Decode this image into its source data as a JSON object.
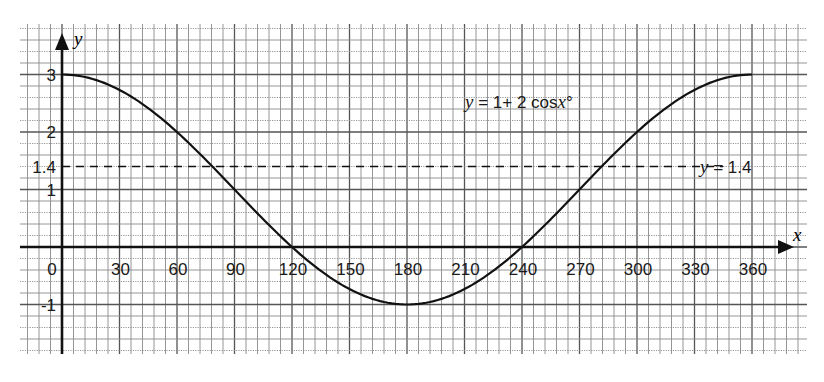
{
  "chart_data": {
    "type": "line",
    "title": "",
    "xlabel": "x",
    "ylabel": "y",
    "xlim": [
      0,
      360
    ],
    "ylim": [
      -1,
      3
    ],
    "grid": true,
    "x_ticks": [
      0,
      30,
      60,
      90,
      120,
      150,
      180,
      210,
      240,
      270,
      300,
      330,
      360
    ],
    "x_tick_labels": [
      "0",
      "30",
      "60",
      "90",
      "120",
      "150",
      "180",
      "210",
      "240",
      "270",
      "300",
      "330",
      "360"
    ],
    "y_ticks": [
      -1,
      1,
      1.4,
      2,
      3
    ],
    "y_tick_labels": [
      "-1",
      "1",
      "1.4",
      "2",
      "3"
    ],
    "series": [
      {
        "name": "y = 1+ 2 cosx°",
        "style": "solid",
        "x": [
          0,
          30,
          60,
          90,
          120,
          150,
          180,
          210,
          240,
          270,
          300,
          330,
          360
        ],
        "values": [
          3,
          2.73,
          2,
          1,
          0,
          -0.73,
          -1,
          -0.73,
          0,
          1,
          2,
          2.73,
          3
        ]
      },
      {
        "name": "y = 1.4",
        "style": "dashed",
        "x": [
          0,
          345
        ],
        "values": [
          1.4,
          1.4
        ]
      }
    ],
    "annotations": [
      {
        "text_var": "y",
        "text_rest": " = 1+ 2 cos",
        "text_var2": "x",
        "text_tail": "°",
        "x": 233,
        "y": 2.35
      },
      {
        "text_var": "y",
        "text_rest": " = 1.4",
        "x": 348,
        "y": 1.4
      }
    ]
  },
  "labels": {
    "x_axis": "x",
    "y_axis": "y",
    "curve_eq_var": "y",
    "curve_eq_mid": " = 1+ 2 cos",
    "curve_eq_var2": "x",
    "curve_eq_tail": "°",
    "line_eq_var": "y",
    "line_eq_rest": " = 1.4"
  }
}
